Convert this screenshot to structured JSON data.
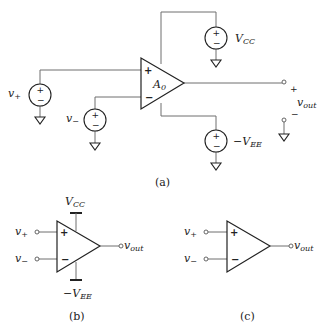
{
  "figure": {
    "a": {
      "caption": "(a)",
      "opamp_gain": "A",
      "opamp_gain_sub": "0",
      "plus_input_sign": "+",
      "minus_input_sign": "−",
      "vcc_label": "V",
      "vcc_sub": "CC",
      "vee_label": "−V",
      "vee_sub": "EE",
      "vplus_label": "v",
      "vplus_sub": "+",
      "vminus_label": "v",
      "vminus_sub": "−",
      "vout_label": "v",
      "vout_sub": "out",
      "vout_plus": "+",
      "vout_minus": "−",
      "source_plus": "+",
      "source_minus": "−"
    },
    "b": {
      "caption": "(b)",
      "vcc_label": "V",
      "vcc_sub": "CC",
      "vee_label": "−V",
      "vee_sub": "EE",
      "vplus_label": "v",
      "vplus_sub": "+",
      "vminus_label": "v",
      "vminus_sub": "−",
      "vout_label": "v",
      "vout_sub": "out",
      "plus_input_sign": "+",
      "minus_input_sign": "−"
    },
    "c": {
      "caption": "(c)",
      "vplus_label": "v",
      "vplus_sub": "+",
      "vminus_label": "v",
      "vminus_sub": "−",
      "vout_label": "v",
      "vout_sub": "out",
      "plus_input_sign": "+",
      "minus_input_sign": "−"
    }
  }
}
